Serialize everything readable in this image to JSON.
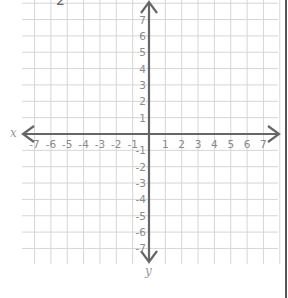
{
  "chart_data": {
    "type": "scatter",
    "title": "",
    "subtitle": "",
    "top_partial_label": "2",
    "xlabel": "x",
    "ylabel": "y",
    "xlim": [
      -7,
      7
    ],
    "ylim": [
      -7,
      7
    ],
    "x_ticks": [
      -7,
      -6,
      -5,
      -4,
      -3,
      -2,
      -1,
      1,
      2,
      3,
      4,
      5,
      6,
      7
    ],
    "y_ticks": [
      7,
      6,
      5,
      4,
      3,
      2,
      1,
      -1,
      -2,
      -3,
      -4,
      -5,
      -6,
      -7
    ],
    "grid": true,
    "arrows": [
      "left",
      "right",
      "up",
      "down"
    ],
    "series": [],
    "colors": {
      "grid": "#d6d6d6",
      "axis": "#666666",
      "labels": "#8a8a8a"
    }
  }
}
